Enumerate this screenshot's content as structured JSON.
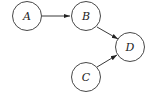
{
  "diagram": {
    "type": "directed-graph",
    "nodes": [
      {
        "id": "A",
        "label": "A"
      },
      {
        "id": "B",
        "label": "B"
      },
      {
        "id": "C",
        "label": "C"
      },
      {
        "id": "D",
        "label": "D"
      }
    ],
    "edges": [
      {
        "from": "A",
        "to": "B"
      },
      {
        "from": "B",
        "to": "D"
      },
      {
        "from": "C",
        "to": "D"
      }
    ],
    "colors": {
      "stroke": "#222222",
      "fill": "#ffffff"
    }
  }
}
